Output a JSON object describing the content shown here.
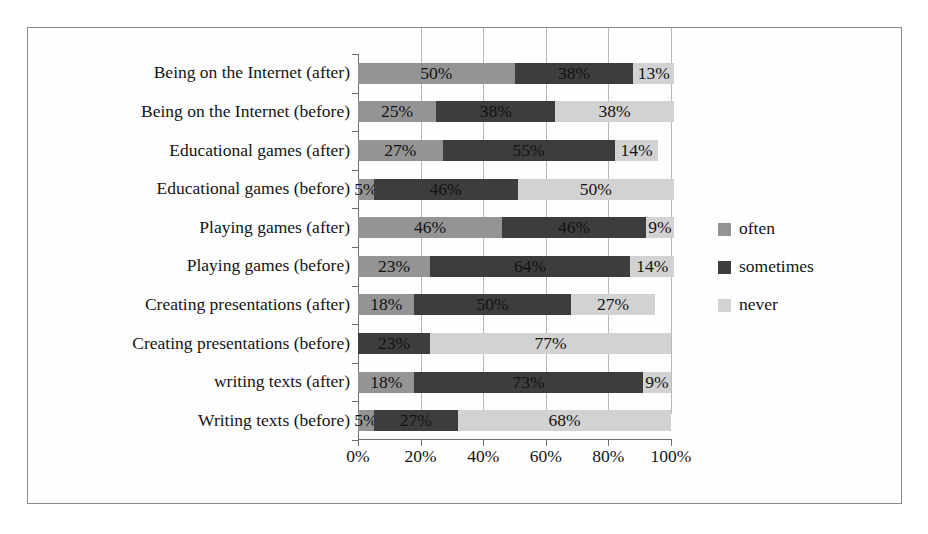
{
  "chart_data": {
    "type": "bar",
    "orientation": "horizontal",
    "stacked": true,
    "title": "",
    "xlabel": "",
    "ylabel": "",
    "xlim": [
      0,
      100
    ],
    "x_ticks": [
      "0%",
      "20%",
      "40%",
      "60%",
      "80%",
      "100%"
    ],
    "x_tick_values": [
      0,
      20,
      40,
      60,
      80,
      100
    ],
    "grid": true,
    "legend_position": "right",
    "categories": [
      "Being on the Internet (after)",
      "Being on the Internet (before)",
      "Educational games (after)",
      "Educational games (before)",
      "Playing games (after)",
      "Playing games (before)",
      "Creating presentations (after)",
      "Creating presentations (before)",
      "writing texts (after)",
      "Writing texts (before)"
    ],
    "series": [
      {
        "name": "often",
        "color": "#949494",
        "values": [
          50,
          25,
          27,
          5,
          46,
          23,
          18,
          0,
          18,
          5
        ],
        "labels": [
          "50%",
          "25%",
          "27%",
          "5%",
          "46%",
          "23%",
          "18%",
          "",
          "18%",
          "5%"
        ]
      },
      {
        "name": "sometimes",
        "color": "#3d3d3d",
        "values": [
          38,
          38,
          55,
          46,
          46,
          64,
          50,
          23,
          73,
          27
        ],
        "labels": [
          "38%",
          "38%",
          "55%",
          "46%",
          "46%",
          "64%",
          "50%",
          "23%",
          "73%",
          "27%"
        ]
      },
      {
        "name": "never",
        "color": "#d2d2d2",
        "values": [
          13,
          38,
          14,
          50,
          9,
          14,
          27,
          77,
          9,
          68
        ],
        "labels": [
          "13%",
          "38%",
          "14%",
          "50%",
          "9%",
          "14%",
          "27%",
          "77%",
          "9%",
          "68%"
        ]
      }
    ]
  },
  "legend": {
    "items": [
      {
        "label": "often",
        "color": "#949494"
      },
      {
        "label": "sometimes",
        "color": "#3d3d3d"
      },
      {
        "label": "never",
        "color": "#d2d2d2"
      }
    ]
  }
}
